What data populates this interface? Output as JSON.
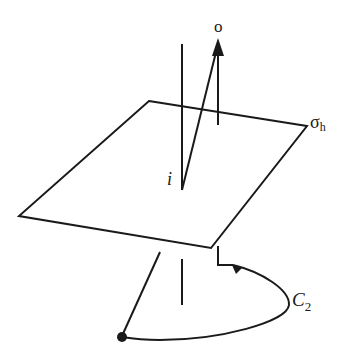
{
  "diagram": {
    "labels": {
      "point_o": "o",
      "plane_symbol": "σ",
      "plane_subscript": "h",
      "inversion": "i",
      "rotation_symbol": "C",
      "rotation_subscript": "2"
    },
    "colors": {
      "stroke": "#1a1a1a",
      "background": "#ffffff"
    }
  }
}
